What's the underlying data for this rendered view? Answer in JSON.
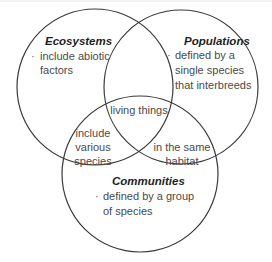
{
  "diagram": {
    "type": "venn",
    "sets": [
      {
        "id": "ecosystems",
        "title": "Ecosystems",
        "bullet": "·",
        "lines": [
          "include abiotic",
          "factors"
        ]
      },
      {
        "id": "populations",
        "title": "Populations",
        "bullet": "·",
        "lines": [
          "defined by a",
          "single species",
          "that interbreeds"
        ]
      },
      {
        "id": "communities",
        "title": "Communities",
        "bullet": "·",
        "lines": [
          "defined by a group",
          "of species"
        ]
      }
    ],
    "intersections": {
      "all_three": [
        "living things"
      ],
      "ecosystems_communities": [
        "include",
        "various",
        "species"
      ],
      "populations_communities": [
        "in the same",
        "habitat"
      ]
    },
    "colors": {
      "stroke": "#3a3a3a",
      "title_text": "#1e1e1e",
      "body_text": "#4a4a4a"
    }
  }
}
